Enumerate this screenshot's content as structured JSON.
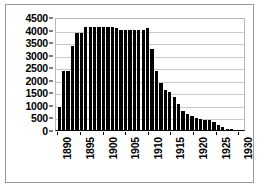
{
  "chart_data": {
    "type": "bar",
    "title": "",
    "subtitle": "",
    "xlabel": "",
    "ylabel": "",
    "grid": true,
    "legend": false,
    "legend_position": "none",
    "bar_color": "#000000",
    "background_color": "#ffffff",
    "gridline_color": "#c9c9c9",
    "axis_color": "#000000",
    "ylim": [
      0,
      4500
    ],
    "yticks": [
      0,
      500,
      1000,
      1500,
      2000,
      2500,
      3000,
      3500,
      4000,
      4500
    ],
    "ytick_labels": [
      "0",
      "500",
      "1000",
      "1500",
      "2000",
      "2500",
      "3000",
      "3500",
      "4000",
      "4500"
    ],
    "xticks": [
      1890,
      1895,
      1900,
      1905,
      1910,
      1915,
      1920,
      1925,
      1930
    ],
    "xtick_labels": [
      "1890",
      "1895",
      "1900",
      "1905",
      "1910",
      "1915",
      "1920",
      "1925",
      "1930"
    ],
    "xtick_rotation": 90,
    "xlim": [
      1889.5,
      1931.5
    ],
    "categories": [
      "1890",
      "1891",
      "1892",
      "1893",
      "1894",
      "1895",
      "1896",
      "1897",
      "1898",
      "1899",
      "1900",
      "1901",
      "1902",
      "1903",
      "1904",
      "1905",
      "1906",
      "1907",
      "1908",
      "1909",
      "1910",
      "1911",
      "1912",
      "1913",
      "1914",
      "1915",
      "1916",
      "1917",
      "1918",
      "1919",
      "1920",
      "1921",
      "1922",
      "1923",
      "1924",
      "1925",
      "1926",
      "1927",
      "1928",
      "1929",
      "1930",
      "1931"
    ],
    "values": [
      920,
      2360,
      2360,
      3330,
      3850,
      3860,
      4100,
      4110,
      4110,
      4110,
      4110,
      4110,
      4090,
      4080,
      3970,
      3970,
      3970,
      3970,
      3970,
      3970,
      4050,
      3240,
      2340,
      1870,
      1580,
      1510,
      1330,
      1030,
      760,
      620,
      540,
      460,
      420,
      400,
      380,
      300,
      215,
      130,
      60,
      30,
      15,
      10
    ]
  },
  "axis": {
    "y_max_label": "4500",
    "y_min_label": "0"
  }
}
